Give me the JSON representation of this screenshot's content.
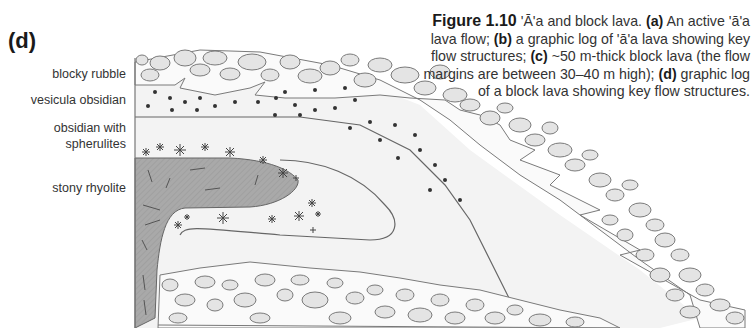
{
  "panel": {
    "label": "(d)"
  },
  "layers": [
    {
      "id": "blocky-rubble",
      "label": "blocky rubble"
    },
    {
      "id": "vesicula-obsidian",
      "label": "vesicula obsidian"
    },
    {
      "id": "obsidian-spherulites",
      "label": "obsidian with\nspherulites",
      "line1": "obsidian with",
      "line2": "spherulites"
    },
    {
      "id": "stony-rhyolite",
      "label": "stony rhyolite"
    }
  ],
  "caption": {
    "figure_number": "Figure 1.10",
    "title": "'Ā'a and block lava.",
    "a_tag": "(a)",
    "a_text": "An active 'ā'a lava flow;",
    "b_tag": "(b)",
    "b_text": "a graphic log of 'ā'a lava showing key flow structures;",
    "c_tag": "(c)",
    "c_text": "~50 m-thick block lava (the flow margins are between 30–40 m high);",
    "d_tag": "(d)",
    "d_text": "graphic log of a block lava showing key flow structures."
  },
  "colors": {
    "rubble_fill": "#e6e6e6",
    "rubble_stroke": "#7a7a7a",
    "obsidian_fill": "#f2f2f2",
    "rhyolite_fill": "#a8a8a8",
    "text": "#333333"
  }
}
